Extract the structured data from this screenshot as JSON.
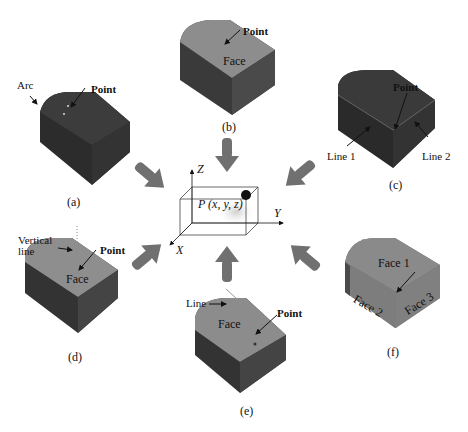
{
  "figure": {
    "center": {
      "axes": {
        "x": "X",
        "y": "Y",
        "z": "Z"
      },
      "point_label": "P (x, y, z)"
    },
    "panels": [
      {
        "id": "a",
        "caption": "(a)",
        "labels": [
          "Arc",
          "Point"
        ]
      },
      {
        "id": "b",
        "caption": "(b)",
        "labels": [
          "Point",
          "Face"
        ]
      },
      {
        "id": "c",
        "caption": "(c)",
        "labels": [
          "Point",
          "Line 1",
          "Line 2"
        ]
      },
      {
        "id": "d",
        "caption": "(d)",
        "labels": [
          "Vertical line",
          "Point",
          "Face"
        ]
      },
      {
        "id": "e",
        "caption": "(e)",
        "labels": [
          "Line",
          "Face",
          "Point"
        ]
      },
      {
        "id": "f",
        "caption": "(f)",
        "labels": [
          "Face 1",
          "Face 2",
          "Face 3"
        ]
      }
    ],
    "colors": {
      "dark_solid": "#3a3a3a",
      "dark_side": "#2a2a2a",
      "light_top": "#8c8c8c",
      "light_side": "#5a5a5a",
      "arrow": "#6f6f6f"
    }
  }
}
